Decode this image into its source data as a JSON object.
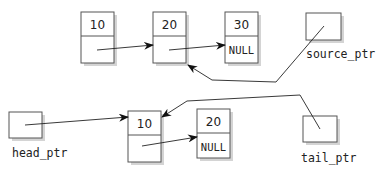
{
  "diagram": {
    "type": "linked-list-copy",
    "source_list": {
      "nodes": [
        {
          "data": "10",
          "next": ""
        },
        {
          "data": "20",
          "next": ""
        },
        {
          "data": "30",
          "next": "NULL"
        }
      ],
      "pointer_label": "source_ptr"
    },
    "copy_list": {
      "nodes": [
        {
          "data": "10",
          "next": ""
        },
        {
          "data": "20",
          "next": "NULL"
        }
      ],
      "head_label": "head_ptr",
      "tail_label": "tail_ptr"
    },
    "edges": [
      {
        "from": "source node 10 next",
        "to": "source node 20"
      },
      {
        "from": "source node 20 next",
        "to": "source node 30"
      },
      {
        "from": "source_ptr",
        "to": "source node 20"
      },
      {
        "from": "head_ptr",
        "to": "copy node 10"
      },
      {
        "from": "copy node 10 next",
        "to": "copy node 20"
      },
      {
        "from": "tail_ptr",
        "to": "copy node 10"
      }
    ]
  }
}
